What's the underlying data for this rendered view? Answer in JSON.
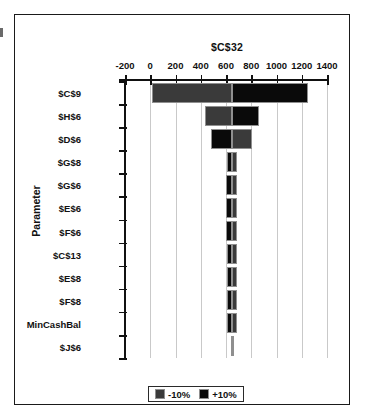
{
  "chart_data": {
    "type": "bar",
    "subtype": "tornado",
    "title": "",
    "xlabel": "$C$32",
    "ylabel": "Parameter",
    "xlim": [
      -200,
      1400
    ],
    "xticks": [
      -200,
      0,
      200,
      400,
      600,
      800,
      1000,
      1200,
      1400
    ],
    "xtick_labels": [
      "-200",
      "0",
      "200",
      "400",
      "600",
      "800",
      "1000",
      "1200",
      "1400"
    ],
    "grid": true,
    "grid_axis": "x",
    "legend_position": "bottom",
    "base_value": 645,
    "categories": [
      "$C$9",
      "$H$6",
      "$D$6",
      "$G$8",
      "$G$6",
      "$E$6",
      "$F$6",
      "$C$13",
      "$E$8",
      "$F$8",
      "MinCashBal",
      "$J$6"
    ],
    "series": [
      {
        "name": "-10%",
        "color": "#3a3a3a",
        "values": [
          10,
          430,
          805,
          685,
          690,
          688,
          687,
          686,
          686,
          686,
          684,
          648
        ]
      },
      {
        "name": "+10%",
        "color": "#0a0a0a",
        "values": [
          1250,
          860,
          480,
          605,
          600,
          602,
          603,
          604,
          604,
          604,
          606,
          642
        ]
      }
    ],
    "legend": [
      {
        "label": "-10%",
        "color": "#3a3a3a"
      },
      {
        "label": "+10%",
        "color": "#0a0a0a"
      }
    ]
  }
}
